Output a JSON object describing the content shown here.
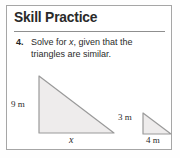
{
  "panel": {
    "title": "Skill Practice"
  },
  "problem": {
    "number": "4.",
    "text_before_var": "Solve for ",
    "variable": "x",
    "text_after_var": ", given that the triangles are similar."
  },
  "figure": {
    "large_triangle": {
      "vertical_leg_label": "9 m",
      "horizontal_leg_label": "x",
      "vertical_leg_value": 9,
      "horizontal_leg_value": null,
      "units": "m"
    },
    "small_triangle": {
      "vertical_leg_label": "3 m",
      "horizontal_leg_label": "4 m",
      "vertical_leg_value": 3,
      "horizontal_leg_value": 4,
      "units": "m"
    }
  },
  "colors": {
    "border": "#a6a6a6",
    "rule": "#8f8f8f",
    "shape_fill": "#eeecec",
    "shape_stroke": "#9a9a9a",
    "text": "#2b2b2b",
    "title_text": "#2a2a2a",
    "page_background": "#ffffff"
  }
}
